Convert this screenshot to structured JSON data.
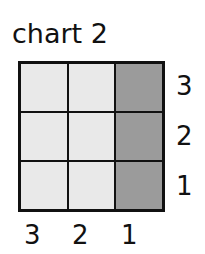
{
  "title": "chart 2",
  "colors": {
    "light": "#e9e9e9",
    "dark": "#9b9b9b",
    "border": "#111111"
  },
  "grid": {
    "rows": 3,
    "cols": 3,
    "cells": [
      [
        "light",
        "light",
        "dark"
      ],
      [
        "light",
        "light",
        "dark"
      ],
      [
        "light",
        "light",
        "dark"
      ]
    ]
  },
  "row_labels": [
    "3",
    "2",
    "1"
  ],
  "col_labels": [
    "3",
    "2",
    "1"
  ]
}
